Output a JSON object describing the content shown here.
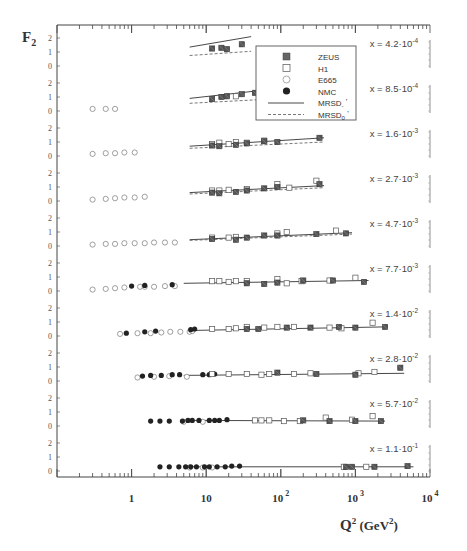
{
  "chart_data": {
    "type": "scatter",
    "title": "",
    "ylabel": "F2",
    "xlabel": "Q² (GeV²)",
    "xscale": "log",
    "xlim": [
      0.1,
      10000
    ],
    "ylim_per_panel": [
      0,
      2.2
    ],
    "y_ticks": [
      "0",
      "1",
      "2"
    ],
    "x_ticks": [
      {
        "value": 1,
        "label": "1",
        "sup": ""
      },
      {
        "value": 10,
        "label": "10",
        "sup": ""
      },
      {
        "value": 100,
        "label": "10",
        "sup": "2"
      },
      {
        "value": 1000,
        "label": "10",
        "sup": "3"
      },
      {
        "value": 10000,
        "label": "10",
        "sup": "4"
      }
    ],
    "legend": {
      "position": "upper-center",
      "entries": [
        {
          "name": "ZEUS",
          "marker": "filled-square"
        },
        {
          "name": "H1",
          "marker": "open-square"
        },
        {
          "name": "E665",
          "marker": "open-circle"
        },
        {
          "name": "NMC",
          "marker": "filled-circle"
        },
        {
          "name": "MRSD_-'",
          "base": "MRSD",
          "sub": "-",
          "prime": "'",
          "line": "solid"
        },
        {
          "name": "MRSD_0'",
          "base": "MRSD",
          "sub": "0",
          "prime": "'",
          "line": "dashed"
        }
      ]
    },
    "panels": [
      {
        "x_label": "x = 4.2·10⁻⁴",
        "x_base": "x = 4.2",
        "x_exp": "-4",
        "ZEUS": [
          [
            12,
            1.25
          ],
          [
            16,
            1.3
          ],
          [
            19,
            1.2
          ],
          [
            30,
            1.55
          ]
        ],
        "H1": [],
        "E665": [],
        "NMC": [],
        "curves": {
          "MRSD_-'": [
            [
              6,
              1.35
            ],
            [
              40,
              2.1
            ]
          ],
          "MRSD_0'": [
            [
              6,
              0.75
            ],
            [
              40,
              1.05
            ]
          ]
        }
      },
      {
        "x_label": "x = 8.5·10⁻⁴",
        "x_base": "x = 8.5",
        "x_exp": "-4",
        "ZEUS": [
          [
            12,
            0.85
          ],
          [
            16,
            1.0
          ],
          [
            19,
            1.05
          ],
          [
            30,
            1.2
          ],
          [
            45,
            1.3
          ],
          [
            70,
            1.5
          ],
          [
            100,
            1.55
          ]
        ],
        "H1": [
          [
            25,
            1.05
          ]
        ],
        "E665": [
          [
            0.3,
            0.15
          ],
          [
            0.45,
            0.15
          ],
          [
            0.6,
            0.15
          ]
        ],
        "NMC": [],
        "curves": {
          "MRSD_-'": [
            [
              6,
              0.9
            ],
            [
              110,
              1.65
            ]
          ],
          "MRSD_0'": [
            [
              6,
              0.55
            ],
            [
              110,
              0.9
            ]
          ]
        }
      },
      {
        "x_label": "x = 1.6·10⁻³",
        "x_base": "x = 1.6",
        "x_exp": "-3",
        "ZEUS": [
          [
            12,
            0.75
          ],
          [
            15,
            0.7
          ],
          [
            25,
            0.8
          ],
          [
            35,
            0.9
          ],
          [
            60,
            1.05
          ],
          [
            90,
            1.0
          ],
          [
            330,
            1.3
          ]
        ],
        "H1": [
          [
            12,
            0.85
          ],
          [
            15,
            0.95
          ],
          [
            20,
            0.85
          ],
          [
            25,
            1.0
          ],
          [
            35,
            0.95
          ],
          [
            60,
            1.1
          ]
        ],
        "E665": [
          [
            0.3,
            0.15
          ],
          [
            0.45,
            0.2
          ],
          [
            0.6,
            0.2
          ],
          [
            0.8,
            0.25
          ],
          [
            1.1,
            0.25
          ]
        ],
        "NMC": [],
        "curves": {
          "MRSD_-'": [
            [
              6,
              0.7
            ],
            [
              380,
              1.3
            ]
          ],
          "MRSD_0'": [
            [
              6,
              0.55
            ],
            [
              380,
              1.0
            ]
          ]
        }
      },
      {
        "x_label": "x = 2.7·10⁻³",
        "x_base": "x = 2.7",
        "x_exp": "-3",
        "ZEUS": [
          [
            12,
            0.6
          ],
          [
            15,
            0.55
          ],
          [
            25,
            0.65
          ],
          [
            35,
            0.75
          ],
          [
            60,
            0.9
          ],
          [
            90,
            1.0
          ],
          [
            330,
            1.2
          ]
        ],
        "H1": [
          [
            12,
            0.75
          ],
          [
            15,
            0.75
          ],
          [
            20,
            0.8
          ],
          [
            35,
            0.85
          ],
          [
            90,
            1.2
          ],
          [
            130,
            0.95
          ],
          [
            300,
            1.45
          ]
        ],
        "E665": [
          [
            0.3,
            0.1
          ],
          [
            0.45,
            0.15
          ],
          [
            0.6,
            0.2
          ],
          [
            0.8,
            0.25
          ],
          [
            1.1,
            0.25
          ],
          [
            1.5,
            0.3
          ]
        ],
        "NMC": [],
        "curves": {
          "MRSD_-'": [
            [
              6,
              0.6
            ],
            [
              380,
              1.1
            ]
          ],
          "MRSD_0'": [
            [
              6,
              0.5
            ],
            [
              380,
              0.95
            ]
          ]
        }
      },
      {
        "x_label": "x = 4.7·10⁻³",
        "x_base": "x = 4.7",
        "x_exp": "-3",
        "ZEUS": [
          [
            12,
            0.5
          ],
          [
            25,
            0.45
          ],
          [
            35,
            0.6
          ],
          [
            60,
            0.75
          ],
          [
            90,
            0.75
          ],
          [
            300,
            0.85
          ],
          [
            750,
            0.9
          ]
        ],
        "H1": [
          [
            12,
            0.6
          ],
          [
            20,
            0.6
          ],
          [
            25,
            0.65
          ],
          [
            90,
            0.9
          ],
          [
            120,
            1.0
          ],
          [
            550,
            1.1
          ]
        ],
        "E665": [
          [
            0.3,
            0.1
          ],
          [
            0.45,
            0.15
          ],
          [
            0.6,
            0.15
          ],
          [
            0.8,
            0.2
          ],
          [
            1.1,
            0.2
          ],
          [
            1.5,
            0.2
          ],
          [
            2.0,
            0.25
          ],
          [
            2.8,
            0.25
          ],
          [
            3.8,
            0.25
          ]
        ],
        "NMC": [],
        "curves": {
          "MRSD_-'": [
            [
              6,
              0.45
            ],
            [
              900,
              0.95
            ]
          ],
          "MRSD_0'": [
            [
              6,
              0.4
            ],
            [
              900,
              0.85
            ]
          ]
        }
      },
      {
        "x_label": "x = 7.7·10⁻³",
        "x_base": "x = 7.7",
        "x_exp": "-3",
        "ZEUS": [
          [
            35,
            0.55
          ],
          [
            60,
            0.5
          ],
          [
            90,
            0.6
          ],
          [
            200,
            0.75
          ],
          [
            500,
            0.75
          ],
          [
            1300,
            0.65
          ]
        ],
        "H1": [
          [
            12,
            0.7
          ],
          [
            15,
            0.7
          ],
          [
            20,
            0.65
          ],
          [
            25,
            0.7
          ],
          [
            35,
            0.7
          ],
          [
            90,
            0.85
          ],
          [
            120,
            0.55
          ],
          [
            190,
            0.7
          ],
          [
            450,
            0.75
          ],
          [
            1000,
            0.95
          ]
        ],
        "E665": [
          [
            0.3,
            0.1
          ],
          [
            0.45,
            0.15
          ],
          [
            0.6,
            0.2
          ],
          [
            0.8,
            0.25
          ],
          [
            1.3,
            0.3
          ],
          [
            1.5,
            0.3
          ],
          [
            2.0,
            0.3
          ],
          [
            2.8,
            0.35
          ],
          [
            3.8,
            0.35
          ]
        ],
        "NMC": [
          [
            1.0,
            0.35
          ],
          [
            1.5,
            0.4
          ],
          [
            3.5,
            0.45
          ]
        ],
        "curves": {
          "MRSD_-'": [
            [
              5,
              0.55
            ],
            [
              1500,
              0.75
            ]
          ]
        }
      },
      {
        "x_label": "x = 1.4·10⁻²",
        "x_base": "x = 1.4",
        "x_exp": "-2",
        "ZEUS": [
          [
            35,
            0.5
          ],
          [
            50,
            0.5
          ],
          [
            120,
            0.6
          ],
          [
            250,
            0.6
          ],
          [
            600,
            0.65
          ],
          [
            1000,
            0.6
          ],
          [
            2500,
            0.65
          ]
        ],
        "H1": [
          [
            12,
            0.5
          ],
          [
            20,
            0.5
          ],
          [
            25,
            0.55
          ],
          [
            35,
            0.65
          ],
          [
            60,
            0.6
          ],
          [
            90,
            0.65
          ],
          [
            150,
            0.65
          ],
          [
            450,
            0.6
          ],
          [
            650,
            0.55
          ],
          [
            1700,
            0.95
          ]
        ],
        "E665": [
          [
            0.7,
            0.15
          ],
          [
            1.2,
            0.2
          ],
          [
            1.8,
            0.2
          ],
          [
            2.5,
            0.25
          ],
          [
            3.3,
            0.3
          ],
          [
            4.5,
            0.3
          ],
          [
            6.0,
            0.3
          ],
          [
            6.5,
            0.35
          ]
        ],
        "NMC": [
          [
            0.85,
            0.2
          ],
          [
            1.5,
            0.3
          ],
          [
            2.1,
            0.35
          ],
          [
            6.2,
            0.45
          ],
          [
            7.0,
            0.5
          ]
        ],
        "curves": {
          "MRSD_-'": [
            [
              7,
              0.4
            ],
            [
              2500,
              0.65
            ]
          ]
        }
      },
      {
        "x_label": "x = 2.8·10⁻²",
        "x_base": "x = 2.8",
        "x_exp": "-2",
        "ZEUS": [
          [
            90,
            0.6
          ],
          [
            300,
            0.5
          ],
          [
            1000,
            0.45
          ],
          [
            4000,
            0.95
          ]
        ],
        "H1": [
          [
            12,
            0.5
          ],
          [
            20,
            0.5
          ],
          [
            35,
            0.5
          ],
          [
            55,
            0.45
          ],
          [
            70,
            0.5
          ],
          [
            150,
            0.5
          ],
          [
            250,
            0.55
          ],
          [
            1100,
            0.55
          ],
          [
            1800,
            0.65
          ]
        ],
        "E665": [
          [
            1.2,
            0.25
          ],
          [
            2.0,
            0.3
          ],
          [
            3.2,
            0.35
          ],
          [
            5.5,
            0.3
          ]
        ],
        "NMC": [
          [
            1.4,
            0.35
          ],
          [
            1.8,
            0.4
          ],
          [
            2.5,
            0.4
          ],
          [
            3.5,
            0.45
          ],
          [
            4.4,
            0.45
          ],
          [
            9,
            0.45
          ],
          [
            11,
            0.45
          ],
          [
            13,
            0.5
          ]
        ],
        "curves": {
          "MRSD_-'": [
            [
              5,
              0.4
            ],
            [
              4500,
              0.55
            ]
          ]
        }
      },
      {
        "x_label": "x = 5.7·10⁻²",
        "x_base": "x = 5.7",
        "x_exp": "-2",
        "ZEUS": [
          [
            200,
            0.4
          ],
          [
            450,
            0.35
          ],
          [
            1000,
            0.35
          ],
          [
            2200,
            0.35
          ]
        ],
        "H1": [
          [
            45,
            0.4
          ],
          [
            55,
            0.4
          ],
          [
            70,
            0.4
          ],
          [
            110,
            0.35
          ],
          [
            180,
            0.35
          ],
          [
            400,
            0.6
          ],
          [
            900,
            0.45
          ],
          [
            1700,
            0.7
          ]
        ],
        "E665": [
          [
            5,
            0.3
          ],
          [
            9,
            0.3
          ]
        ],
        "NMC": [
          [
            1.8,
            0.35
          ],
          [
            2.4,
            0.35
          ],
          [
            3.2,
            0.35
          ],
          [
            4.8,
            0.35
          ],
          [
            5.7,
            0.4
          ],
          [
            6.5,
            0.4
          ],
          [
            8,
            0.4
          ],
          [
            11,
            0.4
          ],
          [
            13,
            0.4
          ],
          [
            15,
            0.4
          ],
          [
            19,
            0.45
          ]
        ],
        "curves": {
          "MRSD_-'": [
            [
              5,
              0.4
            ],
            [
              2500,
              0.35
            ]
          ]
        }
      },
      {
        "x_label": "x = 1.1·10⁻¹",
        "x_base": "x = 1.1",
        "x_exp": "-1",
        "ZEUS": [
          [
            750,
            0.3
          ],
          [
            900,
            0.3
          ],
          [
            1800,
            0.3
          ],
          [
            5000,
            0.35
          ]
        ],
        "H1": [
          [
            700,
            0.3
          ],
          [
            1400,
            0.3
          ]
        ],
        "E665": [
          [
            6,
            0.25
          ],
          [
            9,
            0.25
          ],
          [
            12,
            0.25
          ]
        ],
        "NMC": [
          [
            2.4,
            0.3
          ],
          [
            3.2,
            0.3
          ],
          [
            4.3,
            0.3
          ],
          [
            5.3,
            0.3
          ],
          [
            6.2,
            0.3
          ],
          [
            7.4,
            0.3
          ],
          [
            9.5,
            0.3
          ],
          [
            11,
            0.3
          ],
          [
            14,
            0.3
          ],
          [
            18,
            0.3
          ],
          [
            22,
            0.35
          ],
          [
            28,
            0.35
          ]
        ],
        "curves": {
          "MRSD_-'": [
            [
              5,
              0.3
            ],
            [
              6000,
              0.3
            ]
          ]
        }
      }
    ]
  }
}
